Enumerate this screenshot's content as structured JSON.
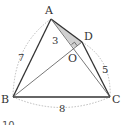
{
  "diagram": {
    "type": "geometry-quadrilateral",
    "points": {
      "A": "A",
      "B": "B",
      "C": "C",
      "D": "D",
      "O": "O"
    },
    "segment_lengths": {
      "AO": "3",
      "AB": "7",
      "DC": "5",
      "BC": "8"
    },
    "colors": {
      "stroke": "#333333",
      "thin_stroke": "#555555",
      "shade": "#cfcfcf",
      "dotted": "#aaaaaa"
    },
    "partial_bottom_text": "10"
  }
}
